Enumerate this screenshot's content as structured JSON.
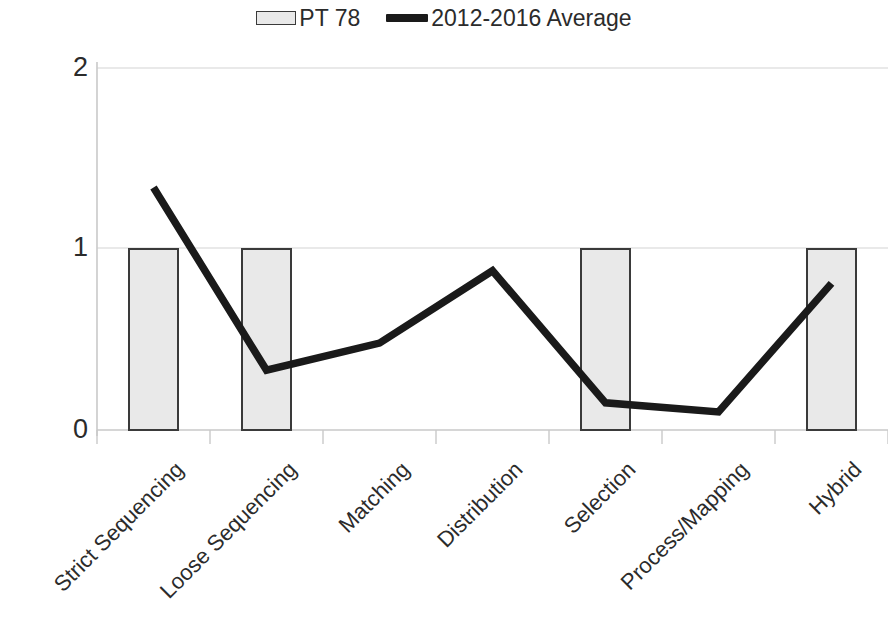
{
  "legend": {
    "entries": [
      {
        "label": "PT 78",
        "marker": "bar-swatch",
        "color": "#e9e9e9"
      },
      {
        "label": "2012-2016 Average",
        "marker": "line-swatch",
        "color": "#1a1a1a"
      }
    ]
  },
  "axes": {
    "y_ticks": [
      "0",
      "1",
      "2"
    ],
    "y_min": 0,
    "y_max": 2,
    "x_categories": [
      "Strict Sequencing",
      "Loose Sequencing",
      "Matching",
      "Distribution",
      "Selection",
      "Process/Mapping",
      "Hybrid"
    ]
  },
  "colors": {
    "bar_fill": "#e9e9e9",
    "bar_stroke": "#3a3a3a",
    "line": "#1a1a1a",
    "grid": "#d4d4d4",
    "axis": "#c9c9c9",
    "text": "#2b2b2b"
  },
  "chart_data": {
    "type": "bar",
    "title": "",
    "xlabel": "",
    "ylabel": "",
    "ylim": [
      0,
      2
    ],
    "yticks": [
      0,
      1,
      2
    ],
    "grid": true,
    "legend_position": "top-center",
    "categories": [
      "Strict Sequencing",
      "Loose Sequencing",
      "Matching",
      "Distribution",
      "Selection",
      "Process/Mapping",
      "Hybrid"
    ],
    "series": [
      {
        "name": "PT 78",
        "type": "bar",
        "values": [
          1,
          1,
          0,
          0,
          1,
          0,
          1
        ]
      },
      {
        "name": "2012-2016 Average",
        "type": "line",
        "values": [
          1.34,
          0.33,
          0.48,
          0.88,
          0.15,
          0.1,
          0.81
        ]
      }
    ]
  }
}
